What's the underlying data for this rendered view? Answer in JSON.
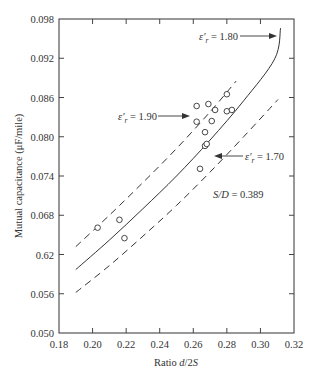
{
  "chart_data": {
    "type": "scatter",
    "title": "",
    "xlabel": "Ratio d/2S",
    "xlabel_parts": [
      "Ratio ",
      "d",
      "/2",
      "S"
    ],
    "ylabel": "Mutual capacitance (μF/mile)",
    "xlim": [
      0.18,
      0.32
    ],
    "ylim": [
      0.05,
      0.098
    ],
    "x_ticks": [
      0.18,
      0.2,
      0.22,
      0.24,
      0.26,
      0.28,
      0.3,
      0.32
    ],
    "x_tick_labels": [
      "0.18",
      "0.20",
      "0.22",
      "0.24",
      "0.26",
      "0.28",
      "0.30",
      "0.32"
    ],
    "y_ticks": [
      0.05,
      0.056,
      0.062,
      0.068,
      0.074,
      0.08,
      0.086,
      0.092,
      0.098
    ],
    "y_tick_labels": [
      "0.050",
      "0.056",
      "0.62",
      "0.068",
      "0.074",
      "0.080",
      "0.086",
      "0.092",
      "0.098"
    ],
    "grid": false,
    "legend": null,
    "series": [
      {
        "name": "Measured data",
        "style": "open-circle",
        "points": [
          [
            0.203,
            0.0661
          ],
          [
            0.216,
            0.0673
          ],
          [
            0.219,
            0.0645
          ],
          [
            0.264,
            0.0751
          ],
          [
            0.267,
            0.0786
          ],
          [
            0.268,
            0.0789
          ],
          [
            0.267,
            0.0807
          ],
          [
            0.262,
            0.0823
          ],
          [
            0.271,
            0.0824
          ],
          [
            0.262,
            0.0847
          ],
          [
            0.269,
            0.085
          ],
          [
            0.273,
            0.0841
          ],
          [
            0.28,
            0.0865
          ],
          [
            0.28,
            0.0839
          ],
          [
            0.283,
            0.0841
          ]
        ]
      },
      {
        "name": "ε'r = 1.90",
        "style": "dashed",
        "points": [
          [
            0.19,
            0.0632
          ],
          [
            0.21,
            0.068
          ],
          [
            0.23,
            0.073
          ],
          [
            0.25,
            0.0782
          ],
          [
            0.27,
            0.0838
          ],
          [
            0.2855,
            0.0885
          ]
        ]
      },
      {
        "name": "ε'r = 1.80",
        "style": "solid",
        "points": [
          [
            0.19,
            0.0597
          ],
          [
            0.21,
            0.0642
          ],
          [
            0.23,
            0.069
          ],
          [
            0.25,
            0.074
          ],
          [
            0.27,
            0.0795
          ],
          [
            0.29,
            0.0855
          ],
          [
            0.3085,
            0.0919
          ],
          [
            0.312,
            0.0966
          ]
        ]
      },
      {
        "name": "ε'r = 1.70",
        "style": "dashed",
        "points": [
          [
            0.19,
            0.0562
          ],
          [
            0.21,
            0.0603
          ],
          [
            0.23,
            0.0648
          ],
          [
            0.25,
            0.0695
          ],
          [
            0.27,
            0.0746
          ],
          [
            0.29,
            0.08
          ],
          [
            0.3105,
            0.0857
          ]
        ]
      }
    ],
    "annotations": [
      {
        "text_prefix": "ε′",
        "sub": "r",
        "text_suffix": " = 1.80",
        "arrow_to": [
          0.31,
          0.0952
        ]
      },
      {
        "text_prefix": "ε′",
        "sub": "r",
        "text_suffix": " = 1.90",
        "arrow_to": [
          0.258,
          0.0822
        ]
      },
      {
        "text_prefix": "ε′",
        "sub": "r",
        "text_suffix": " = 1.70",
        "arrow_to": [
          0.275,
          0.0765
        ]
      },
      {
        "text": "S/D = 0.389"
      }
    ]
  },
  "labels": {
    "xlabel_plain": "Ratio ",
    "xlabel_italic": "d",
    "xlabel_mid": "/2",
    "xlabel_italic2": "S",
    "ylabel": "Mutual capacitance (μF/mile)",
    "eps_180": " = 1.80",
    "eps_190": " = 1.90",
    "eps_170": " = 1.70",
    "eps_symbol": "ε",
    "eps_prime": "′",
    "eps_sub": "r",
    "sd_italic": "S/D",
    "sd_value": " = 0.389"
  }
}
